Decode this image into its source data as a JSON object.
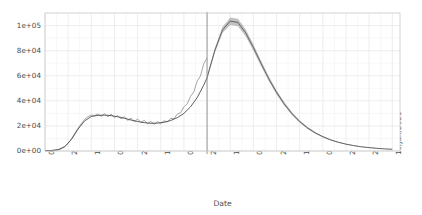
{
  "chart_data": {
    "type": "line",
    "title": "",
    "xlabel": "Date",
    "ylabel": "New cases per day",
    "grid": true,
    "legend": false,
    "xlim": [
      "01/Mar/2020",
      "17/Jan/2021"
    ],
    "ylim": [
      0,
      110000
    ],
    "y_ticks": [
      {
        "value": 0,
        "label": "0e+00"
      },
      {
        "value": 20000,
        "label": "2e+04"
      },
      {
        "value": 40000,
        "label": "4e+04"
      },
      {
        "value": 60000,
        "label": "6e+04"
      },
      {
        "value": 80000,
        "label": "8e+04"
      },
      {
        "value": 100000,
        "label": "1e+05"
      }
    ],
    "x_ticks": [
      {
        "day": 0,
        "label": "01/Mar/2020"
      },
      {
        "day": 21,
        "label": "22/Mar/2020"
      },
      {
        "day": 42,
        "label": "12/Apr/2020"
      },
      {
        "day": 63,
        "label": "03/May/2020"
      },
      {
        "day": 84,
        "label": "24/May/2020"
      },
      {
        "day": 105,
        "label": "14/Jun/2020"
      },
      {
        "day": 126,
        "label": "05/Jul/2020"
      },
      {
        "day": 147,
        "label": "26/Jul/2020"
      },
      {
        "day": 168,
        "label": "16/Aug/2020"
      },
      {
        "day": 189,
        "label": "06/Sep/2020"
      },
      {
        "day": 210,
        "label": "27/Sep/2020"
      },
      {
        "day": 231,
        "label": "18/Oct/2020"
      },
      {
        "day": 252,
        "label": "08/Nov/2020"
      },
      {
        "day": 273,
        "label": "29/Nov/2020"
      },
      {
        "day": 294,
        "label": "20/Dec/2020"
      },
      {
        "day": 315,
        "label": "10/Jan/2021"
      }
    ],
    "forecast_divider_day": 147,
    "series": [
      {
        "name": "observed",
        "style": "noisy-line",
        "color": "#808080",
        "x": [
          0,
          3,
          6,
          9,
          12,
          15,
          18,
          21,
          24,
          27,
          30,
          33,
          36,
          39,
          42,
          45,
          48,
          51,
          54,
          57,
          60,
          63,
          66,
          69,
          72,
          75,
          78,
          81,
          84,
          87,
          90,
          93,
          96,
          99,
          102,
          105,
          108,
          111,
          114,
          117,
          120,
          123,
          126,
          129,
          132,
          135,
          138,
          141,
          144,
          147
        ],
        "y": [
          200,
          260,
          340,
          500,
          900,
          1800,
          3600,
          6200,
          9800,
          14000,
          18200,
          22000,
          25200,
          27400,
          28600,
          28300,
          29600,
          27500,
          29800,
          27200,
          29400,
          26600,
          28300,
          25600,
          27400,
          24300,
          26200,
          23300,
          25600,
          22600,
          24500,
          21700,
          23600,
          21300,
          23400,
          21900,
          24100,
          23100,
          26000,
          25700,
          29500,
          30500,
          35200,
          37600,
          43500,
          47200,
          55600,
          59800,
          69500,
          74000
        ]
      },
      {
        "name": "fitted",
        "style": "smooth-line",
        "color": "#4d4d4d",
        "x": [
          0,
          6,
          12,
          18,
          24,
          30,
          36,
          42,
          48,
          54,
          60,
          66,
          72,
          78,
          84,
          90,
          96,
          102,
          108,
          114,
          120,
          126,
          132,
          138,
          144,
          147
        ],
        "y": [
          250,
          420,
          1100,
          3500,
          9200,
          17500,
          24000,
          27500,
          28400,
          28600,
          28200,
          27300,
          26100,
          24700,
          23500,
          22600,
          22100,
          22200,
          22900,
          24300,
          26600,
          30000,
          35200,
          42500,
          52500,
          58500
        ]
      },
      {
        "name": "forecast-band-upper",
        "style": "band",
        "color": "#909090",
        "x": [
          147,
          154,
          161,
          168,
          175,
          182,
          189,
          196,
          203,
          210,
          217,
          224,
          231,
          238,
          245,
          252,
          259,
          266,
          273,
          280,
          287,
          294,
          301,
          308,
          315
        ],
        "y": [
          60000,
          82000,
          99000,
          106500,
          105500,
          97000,
          85000,
          72000,
          59500,
          48500,
          39000,
          31000,
          24500,
          19400,
          15200,
          12000,
          9400,
          7400,
          5800,
          4600,
          3600,
          2900,
          2300,
          1800,
          1500
        ]
      },
      {
        "name": "forecast-band-lower",
        "style": "band",
        "color": "#909090",
        "x": [
          147,
          154,
          161,
          168,
          175,
          182,
          189,
          196,
          203,
          210,
          217,
          224,
          231,
          238,
          245,
          252,
          259,
          266,
          273,
          280,
          287,
          294,
          301,
          308,
          315
        ],
        "y": [
          57000,
          78000,
          94000,
          100500,
          99500,
          91500,
          80000,
          67500,
          55500,
          45000,
          36000,
          28500,
          22500,
          17600,
          13800,
          10800,
          8400,
          6600,
          5100,
          4000,
          3100,
          2500,
          1950,
          1550,
          1250
        ]
      },
      {
        "name": "forecast-median",
        "style": "line",
        "color": "#595959",
        "x": [
          147,
          154,
          161,
          168,
          175,
          182,
          189,
          196,
          203,
          210,
          217,
          224,
          231,
          238,
          245,
          252,
          259,
          266,
          273,
          280,
          287,
          294,
          301,
          308,
          315
        ],
        "y": [
          58500,
          80000,
          96500,
          103500,
          102500,
          94200,
          82500,
          69800,
          57500,
          46800,
          37500,
          29800,
          23500,
          18500,
          14500,
          11400,
          8900,
          7000,
          5450,
          4300,
          3350,
          2700,
          2125,
          1675,
          1375
        ]
      }
    ],
    "annotations": [
      {
        "name": "forecast-divider",
        "type": "vline",
        "day": 147,
        "color": "#8c8c8c"
      }
    ]
  },
  "axes": {
    "y_title": "New cases per day",
    "x_title": "Date"
  }
}
